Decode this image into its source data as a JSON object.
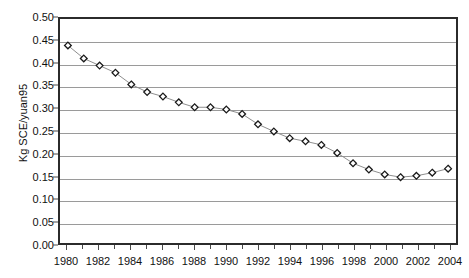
{
  "chart_data": {
    "type": "line",
    "title": "",
    "subtitle": "",
    "xlabel": "",
    "ylabel": "Kg SCE/yuan95",
    "xlim": [
      1979.5,
      2004.5
    ],
    "ylim": [
      0.0,
      0.5
    ],
    "ytick_step": 0.05,
    "xtick_step": 1,
    "xtick_label_step": 2,
    "grid": "horizontal",
    "legend": "none",
    "marker": "diamond-open",
    "line_color": "#8c8c8c",
    "marker_edge_color": "#1a1a1a",
    "marker_face_color": "#ffffff",
    "gridline_color": "#9a9a9a",
    "frame_color": "#2b2b2b",
    "x": [
      1980,
      1981,
      1982,
      1983,
      1984,
      1985,
      1986,
      1987,
      1988,
      1989,
      1990,
      1991,
      1992,
      1993,
      1994,
      1995,
      1996,
      1997,
      1998,
      1999,
      2000,
      2001,
      2002,
      2003,
      2004
    ],
    "values": [
      0.441,
      0.412,
      0.396,
      0.38,
      0.354,
      0.337,
      0.327,
      0.314,
      0.303,
      0.303,
      0.298,
      0.288,
      0.265,
      0.249,
      0.234,
      0.227,
      0.219,
      0.201,
      0.178,
      0.164,
      0.153,
      0.147,
      0.15,
      0.157,
      0.166
    ],
    "ytick_labels": [
      "0.00",
      "0.05",
      "0.10",
      "0.15",
      "0.20",
      "0.25",
      "0.30",
      "0.35",
      "0.40",
      "0.45",
      "0.50"
    ],
    "ytick_values": [
      0.0,
      0.05,
      0.1,
      0.15,
      0.2,
      0.25,
      0.3,
      0.35,
      0.4,
      0.45,
      0.5
    ],
    "xtick_labels": [
      "1980",
      "1982",
      "1984",
      "1986",
      "1988",
      "1990",
      "1992",
      "1994",
      "1996",
      "1998",
      "2000",
      "2002",
      "2004"
    ],
    "xtick_values": [
      1980,
      1982,
      1984,
      1986,
      1988,
      1990,
      1992,
      1994,
      1996,
      1998,
      2000,
      2002,
      2004
    ]
  }
}
